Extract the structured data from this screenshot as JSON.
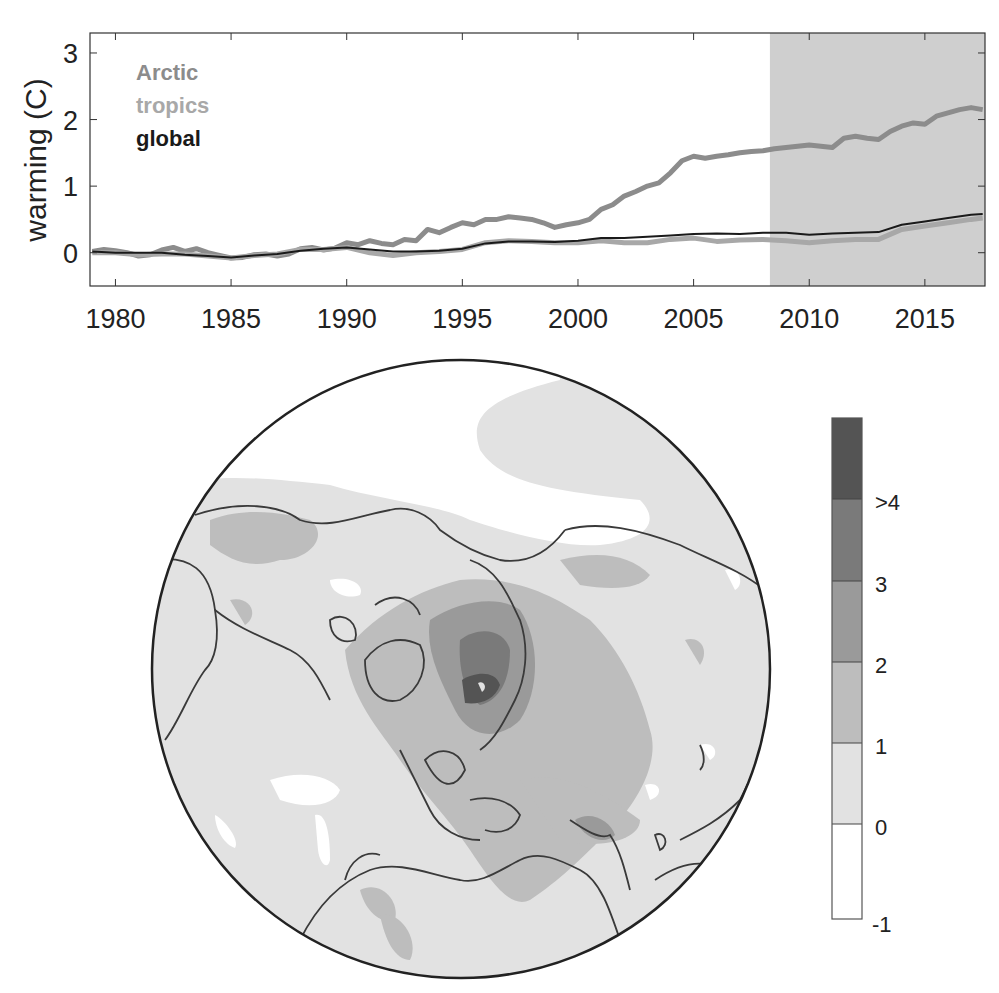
{
  "chart_data": [
    {
      "type": "line",
      "title": "",
      "xlabel": "",
      "ylabel": "warming (C)",
      "xlim": [
        1978.9,
        2017.6
      ],
      "ylim": [
        -0.5,
        3.3
      ],
      "xticks": [
        1980,
        1985,
        1990,
        1995,
        2000,
        2005,
        2010,
        2015
      ],
      "yticks": [
        0,
        1,
        2,
        3
      ],
      "grid": false,
      "legend_position": "upper-left-inside",
      "shaded_region": {
        "x_start": 2008.3,
        "x_end": 2017.6,
        "color": "#cfcfcf"
      },
      "series": [
        {
          "name": "Arctic",
          "color": "#8c8c8c",
          "line_width": 5,
          "x": [
            1979,
            1979.5,
            1980,
            1980.5,
            1981,
            1981.5,
            1982,
            1982.5,
            1983,
            1983.5,
            1984,
            1984.5,
            1985,
            1985.5,
            1986,
            1986.5,
            1987,
            1987.5,
            1988,
            1988.5,
            1989,
            1989.5,
            1990,
            1990.5,
            1991,
            1991.5,
            1992,
            1992.5,
            1993,
            1993.5,
            1994,
            1994.5,
            1995,
            1995.5,
            1996,
            1996.5,
            1997,
            1997.5,
            1998,
            1998.5,
            1999,
            1999.5,
            2000,
            2000.5,
            2001,
            2001.5,
            2002,
            2002.5,
            2003,
            2003.5,
            2004,
            2004.5,
            2005,
            2005.5,
            2006,
            2006.5,
            2007,
            2007.5,
            2008,
            2008.5,
            2009,
            2009.5,
            2010,
            2010.5,
            2011,
            2011.5,
            2012,
            2012.5,
            2013,
            2013.5,
            2014,
            2014.5,
            2015,
            2015.5,
            2016,
            2016.5,
            2017,
            2017.5
          ],
          "values": [
            0.02,
            0.05,
            0.03,
            0.0,
            -0.05,
            -0.03,
            0.04,
            0.08,
            0.02,
            0.06,
            0.0,
            -0.04,
            -0.08,
            -0.07,
            -0.03,
            -0.02,
            -0.05,
            -0.02,
            0.06,
            0.08,
            0.04,
            0.07,
            0.15,
            0.12,
            0.18,
            0.14,
            0.12,
            0.2,
            0.18,
            0.35,
            0.3,
            0.38,
            0.45,
            0.42,
            0.5,
            0.5,
            0.54,
            0.52,
            0.5,
            0.45,
            0.38,
            0.42,
            0.45,
            0.5,
            0.65,
            0.72,
            0.85,
            0.92,
            1.0,
            1.05,
            1.2,
            1.38,
            1.45,
            1.42,
            1.45,
            1.47,
            1.5,
            1.52,
            1.53,
            1.56,
            1.58,
            1.6,
            1.62,
            1.6,
            1.58,
            1.72,
            1.75,
            1.72,
            1.7,
            1.82,
            1.9,
            1.95,
            1.93,
            2.05,
            2.1,
            2.15,
            2.18,
            2.15
          ]
        },
        {
          "name": "tropics",
          "color": "#a8a8a8",
          "line_width": 5,
          "x": [
            1979,
            1980,
            1981,
            1982,
            1983,
            1984,
            1985,
            1986,
            1987,
            1988,
            1989,
            1990,
            1991,
            1992,
            1993,
            1994,
            1995,
            1996,
            1997,
            1998,
            1999,
            2000,
            2001,
            2002,
            2003,
            2004,
            2005,
            2006,
            2007,
            2008,
            2009,
            2010,
            2011,
            2012,
            2013,
            2014,
            2015,
            2016,
            2017,
            2017.5
          ],
          "values": [
            0.0,
            0.0,
            -0.03,
            -0.02,
            -0.02,
            -0.05,
            -0.08,
            -0.04,
            -0.02,
            0.05,
            0.05,
            0.08,
            0.0,
            -0.04,
            0.0,
            0.02,
            0.05,
            0.15,
            0.18,
            0.17,
            0.15,
            0.15,
            0.18,
            0.15,
            0.15,
            0.2,
            0.22,
            0.17,
            0.19,
            0.2,
            0.18,
            0.15,
            0.18,
            0.2,
            0.2,
            0.35,
            0.4,
            0.45,
            0.5,
            0.52
          ]
        },
        {
          "name": "global",
          "color": "#1a1a1a",
          "line_width": 2,
          "x": [
            1979,
            1980,
            1981,
            1982,
            1983,
            1984,
            1985,
            1986,
            1987,
            1988,
            1989,
            1990,
            1991,
            1992,
            1993,
            1994,
            1995,
            1996,
            1997,
            1998,
            1999,
            2000,
            2001,
            2002,
            2003,
            2004,
            2005,
            2006,
            2007,
            2008,
            2009,
            2010,
            2011,
            2012,
            2013,
            2014,
            2015,
            2016,
            2017,
            2017.5
          ],
          "values": [
            0.02,
            0.0,
            0.0,
            0.0,
            -0.03,
            -0.05,
            -0.07,
            -0.04,
            -0.02,
            0.03,
            0.06,
            0.08,
            0.05,
            0.02,
            0.02,
            0.03,
            0.06,
            0.14,
            0.17,
            0.17,
            0.16,
            0.18,
            0.22,
            0.22,
            0.24,
            0.26,
            0.28,
            0.29,
            0.28,
            0.3,
            0.3,
            0.27,
            0.29,
            0.3,
            0.31,
            0.42,
            0.47,
            0.52,
            0.57,
            0.58
          ]
        }
      ]
    },
    {
      "type": "heatmap",
      "title": "",
      "projection": "north-polar-stereographic",
      "description": "Map of warming across the Northern Hemisphere, strongest over the Arctic (Barents/Kara Sea region)",
      "colorbar": {
        "orientation": "vertical",
        "levels": [
          {
            "range": [
              -1,
              0
            ],
            "color": "#ffffff"
          },
          {
            "range": [
              0,
              1
            ],
            "color": "#e2e2e2"
          },
          {
            "range": [
              1,
              2
            ],
            "color": "#bdbdbd"
          },
          {
            "range": [
              2,
              3
            ],
            "color": "#9a9a9a"
          },
          {
            "range": [
              3,
              4
            ],
            "color": "#7a7a7a"
          },
          {
            "range": [
              4,
              5
            ],
            "color": "#545454"
          }
        ],
        "tick_labels": [
          "-1",
          "0",
          "1",
          "2",
          "3",
          ">4"
        ]
      }
    }
  ],
  "top_chart": {
    "ylabel": "warming (C)",
    "xticks": [
      "1980",
      "1985",
      "1990",
      "1995",
      "2000",
      "2005",
      "2010",
      "2015"
    ],
    "yticks": [
      "0",
      "1",
      "2",
      "3"
    ],
    "legend": [
      {
        "label": "Arctic",
        "color": "#8c8c8c"
      },
      {
        "label": "tropics",
        "color": "#a8a8a8"
      },
      {
        "label": "global",
        "color": "#1a1a1a"
      }
    ]
  },
  "colorbar_labels": [
    "-1",
    "0",
    "1",
    "2",
    "3",
    ">4"
  ]
}
